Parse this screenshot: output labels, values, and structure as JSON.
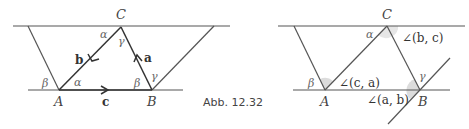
{
  "caption": "Abb. 12.32",
  "left_figure": {
    "vertices": {
      "A": "A",
      "B": "B",
      "C": "C"
    },
    "vectors": {
      "a": "a",
      "b": "b",
      "c": "c"
    },
    "angles": {
      "alpha_top": "α",
      "gamma_top": "γ",
      "beta_left": "β",
      "alpha_bottom": "α",
      "beta_bottom": "β",
      "gamma_bottom": "γ"
    }
  },
  "right_figure": {
    "vertices": {
      "A": "A",
      "B": "B",
      "C": "C"
    },
    "angles": {
      "alpha": "α",
      "beta": "β",
      "gamma": "γ"
    },
    "angle_labels": {
      "bc": "∠(b, c)",
      "ca": "∠(c, a)",
      "ab": "∠(a, b)"
    }
  },
  "colors": {
    "line": "#555555",
    "shade": "#d9d9d9"
  }
}
